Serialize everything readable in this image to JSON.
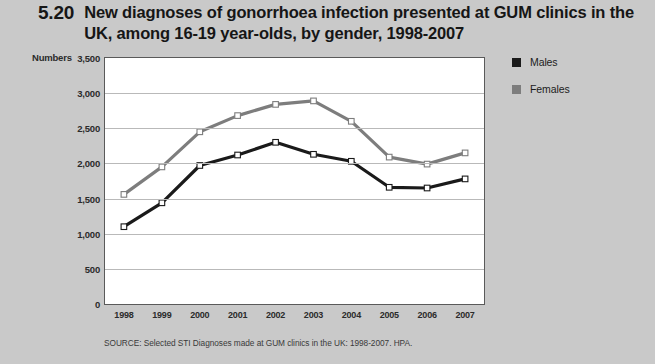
{
  "figure": {
    "number": "5.20",
    "title": "New diagnoses of gonorrhoea infection presented at GUM clinics in the UK, among 16-19 year-olds, by gender, 1998-2007"
  },
  "source": "SOURCE: Selected STI Diagnoses  made at GUM clinics in the UK: 1998-2007. HPA.",
  "legend": {
    "items": [
      {
        "label": "Males",
        "color": "#1a1a1a",
        "icon": "square-swatch"
      },
      {
        "label": "Females",
        "color": "#7d7d7d",
        "icon": "square-swatch"
      }
    ]
  },
  "axes": {
    "y_title": "Numbers",
    "y_ticks": [
      "3,500",
      "3,000",
      "2,500",
      "2,000",
      "1,500",
      "1,000",
      "500",
      "0"
    ],
    "x_ticks": [
      "1998",
      "1999",
      "2000",
      "2001",
      "2002",
      "2003",
      "2004",
      "2005",
      "2006",
      "2007"
    ]
  },
  "chart_data": {
    "type": "line",
    "title": "New diagnoses of gonorrhoea infection presented at GUM clinics in the UK, among 16-19 year-olds, by gender, 1998-2007",
    "xlabel": "",
    "ylabel": "Numbers",
    "categories": [
      "1998",
      "1999",
      "2000",
      "2001",
      "2002",
      "2003",
      "2004",
      "2005",
      "2006",
      "2007"
    ],
    "series": [
      {
        "name": "Males",
        "color": "#1a1a1a",
        "values": [
          1100,
          1440,
          1970,
          2120,
          2300,
          2130,
          2030,
          1660,
          1650,
          1780
        ]
      },
      {
        "name": "Females",
        "color": "#7d7d7d",
        "values": [
          1560,
          1950,
          2450,
          2680,
          2840,
          2890,
          2600,
          2090,
          1990,
          2150
        ]
      }
    ],
    "ylim": [
      0,
      3500
    ],
    "ytick_values": [
      0,
      500,
      1000,
      1500,
      2000,
      2500,
      3000,
      3500
    ],
    "grid": true,
    "markers": "open-square",
    "legend_position": "right-top"
  }
}
